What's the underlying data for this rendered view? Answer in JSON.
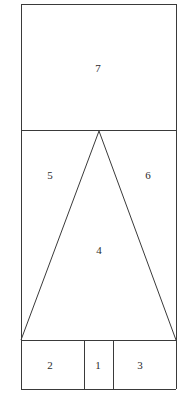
{
  "diagram": {
    "kind": "geometric-net",
    "canvas": {
      "width": 183,
      "height": 402,
      "background": "#ffffff"
    },
    "style": {
      "stroke_color": "#3a3a3a",
      "stroke_width": 1,
      "face_fill": "#ffffff",
      "label_color": "#2b2b2b",
      "label_font_size": 11
    },
    "outer_boundary": {
      "left": 21,
      "top": 4,
      "right": 176,
      "bottom": 389
    },
    "guides": {
      "top_band_divider_y": 130,
      "bottom_band_divider_y": 340,
      "bottom_split_x_left": 84,
      "bottom_split_x_right": 113
    },
    "triangle": {
      "apex": {
        "x": 99,
        "y": 131
      },
      "base_left": {
        "x": 21,
        "y": 340
      },
      "base_right": {
        "x": 176,
        "y": 340
      }
    },
    "faces": [
      {
        "id": "face-7",
        "label": "7",
        "shape": "rectangle",
        "cx": 98,
        "cy": 68,
        "bounds": {
          "left": 21,
          "top": 4,
          "right": 176,
          "bottom": 130
        }
      },
      {
        "id": "face-5",
        "label": "5",
        "shape": "triangle",
        "cx": 50,
        "cy": 175,
        "points": "21,130 99,131 21,340"
      },
      {
        "id": "face-6",
        "label": "6",
        "shape": "triangle",
        "cx": 148,
        "cy": 175,
        "points": "99,131 176,130 176,340"
      },
      {
        "id": "face-4",
        "label": "4",
        "shape": "triangle",
        "cx": 99,
        "cy": 250,
        "points": "99,131 176,340 21,340"
      },
      {
        "id": "face-2",
        "label": "2",
        "shape": "rectangle",
        "cx": 50,
        "cy": 365,
        "bounds": {
          "left": 21,
          "top": 340,
          "right": 84,
          "bottom": 389
        }
      },
      {
        "id": "face-1",
        "label": "1",
        "shape": "rectangle",
        "cx": 98,
        "cy": 365,
        "bounds": {
          "left": 84,
          "top": 340,
          "right": 113,
          "bottom": 389
        }
      },
      {
        "id": "face-3",
        "label": "3",
        "shape": "rectangle",
        "cx": 140,
        "cy": 365,
        "bounds": {
          "left": 113,
          "top": 340,
          "right": 176,
          "bottom": 389
        }
      }
    ],
    "segments": [
      {
        "id": "outer-top",
        "x1": 21,
        "y1": 4,
        "x2": 176,
        "y2": 4,
        "type": "straight"
      },
      {
        "id": "outer-left-upper",
        "x1": 21,
        "y1": 4,
        "x2": 21,
        "y2": 130,
        "type": "straight"
      },
      {
        "id": "outer-right-upper",
        "x1": 176,
        "y1": 4,
        "x2": 176,
        "y2": 130,
        "type": "straight"
      },
      {
        "id": "divider-top-band",
        "x1": 21,
        "y1": 130,
        "x2": 176,
        "y2": 130,
        "type": "straight"
      },
      {
        "id": "outer-left-middle",
        "x1": 21,
        "y1": 130,
        "x2": 21,
        "y2": 340,
        "type": "straight"
      },
      {
        "id": "outer-right-middle",
        "x1": 176,
        "y1": 130,
        "x2": 176,
        "y2": 340,
        "type": "straight"
      },
      {
        "id": "divider-bottom-band",
        "x1": 21,
        "y1": 340,
        "x2": 176,
        "y2": 340,
        "type": "straight"
      },
      {
        "id": "outer-left-lower",
        "x1": 21,
        "y1": 340,
        "x2": 21,
        "y2": 389,
        "type": "straight"
      },
      {
        "id": "outer-right-lower",
        "x1": 176,
        "y1": 340,
        "x2": 176,
        "y2": 389,
        "type": "straight"
      },
      {
        "id": "outer-bottom",
        "x1": 21,
        "y1": 389,
        "x2": 176,
        "y2": 389,
        "type": "straight"
      },
      {
        "id": "bottom-split-left",
        "x1": 84,
        "y1": 340,
        "x2": 84,
        "y2": 389,
        "type": "straight"
      },
      {
        "id": "bottom-split-right",
        "x1": 113,
        "y1": 340,
        "x2": 113,
        "y2": 389,
        "type": "straight"
      },
      {
        "id": "triangle-left-edge",
        "x1": 99,
        "y1": 131,
        "x2": 21,
        "y2": 340,
        "type": "diagonal"
      },
      {
        "id": "triangle-right-edge",
        "x1": 99,
        "y1": 131,
        "x2": 176,
        "y2": 340,
        "type": "diagonal"
      }
    ]
  }
}
